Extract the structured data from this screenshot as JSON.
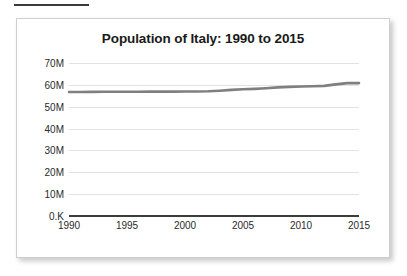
{
  "rule": {
    "label": ""
  },
  "card": {
    "title": "Population of Italy: 1990 to 2015"
  },
  "chart_data": {
    "type": "line",
    "title": "Population of Italy: 1990 to 2015",
    "xlabel": "",
    "ylabel": "",
    "grid": true,
    "legend": "none",
    "line_color": "#7f7f7f",
    "axis_color": "#3c3c3c",
    "grid_color": "#e3e3e3",
    "xlim": [
      1990,
      2015
    ],
    "ylim": [
      0,
      70000000
    ],
    "xticks": [
      1990,
      1995,
      2000,
      2005,
      2010,
      2015
    ],
    "xtick_labels": [
      "1990",
      "1995",
      "2000",
      "2005",
      "2010",
      "2015"
    ],
    "yticks": [
      0,
      10000000,
      20000000,
      30000000,
      40000000,
      50000000,
      60000000,
      70000000
    ],
    "ytick_labels": [
      "0.K",
      "10M",
      "20M",
      "30M",
      "40M",
      "50M",
      "60M",
      "70M"
    ],
    "x": [
      1990,
      1991,
      1992,
      1993,
      1994,
      1995,
      1996,
      1997,
      1998,
      1999,
      2000,
      2001,
      2002,
      2003,
      2004,
      2005,
      2006,
      2007,
      2008,
      2009,
      2010,
      2011,
      2012,
      2013,
      2014,
      2015
    ],
    "values": [
      56719000,
      56758000,
      56797000,
      56832000,
      56843000,
      56844000,
      56860000,
      56890000,
      56907000,
      56916000,
      56942000,
      56974000,
      57059000,
      57313000,
      57685000,
      57969000,
      58144000,
      58438000,
      58827000,
      59095000,
      59277000,
      59379000,
      59540000,
      60234000,
      60789000,
      60796000
    ],
    "series": [
      {
        "name": "Population of Italy",
        "values": [
          56719000,
          56758000,
          56797000,
          56832000,
          56843000,
          56844000,
          56860000,
          56890000,
          56907000,
          56916000,
          56942000,
          56974000,
          57059000,
          57313000,
          57685000,
          57969000,
          58144000,
          58438000,
          58827000,
          59095000,
          59277000,
          59379000,
          59540000,
          60234000,
          60789000,
          60796000
        ]
      }
    ]
  }
}
